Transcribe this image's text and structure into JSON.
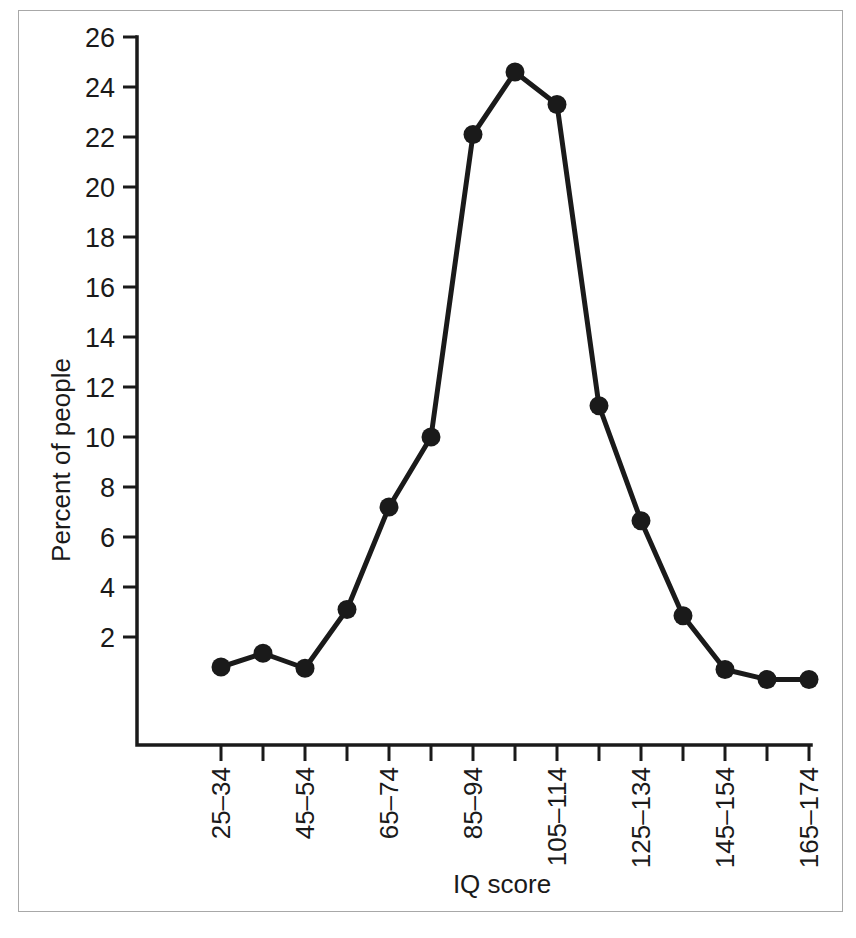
{
  "chart_data": {
    "type": "line",
    "title": "",
    "xlabel": "IQ score",
    "ylabel": "Percent of people",
    "categories": [
      "25–34",
      "35–44",
      "45–54",
      "55–64",
      "65–74",
      "75–84",
      "85–94",
      "95–104",
      "105–114",
      "115–124",
      "125–134",
      "135–144",
      "145–154",
      "155–164",
      "165–174"
    ],
    "visible_tick_labels": [
      "25–34",
      "",
      "45–54",
      "",
      "65–74",
      "",
      "85–94",
      "",
      "105–114",
      "",
      "125–134",
      "",
      "145–154",
      "",
      "165–174"
    ],
    "values": [
      0.8,
      1.35,
      0.75,
      3.1,
      7.2,
      10.0,
      22.1,
      24.6,
      23.3,
      11.25,
      6.65,
      2.85,
      0.7,
      0.3,
      0.3
    ],
    "ylim": [
      0,
      26
    ],
    "ytick_values": [
      2,
      4,
      6,
      8,
      10,
      12,
      14,
      16,
      18,
      20,
      22,
      24,
      26
    ],
    "ytick_labels": [
      "2",
      "4",
      "6",
      "8",
      "10",
      "12",
      "14",
      "16",
      "18",
      "20",
      "22",
      "24",
      "26"
    ],
    "grid": false,
    "legend": "none",
    "marker": "filled-circle",
    "line_color": "#1a1a1a",
    "marker_color": "#1a1a1a",
    "background_color": "#ffffff",
    "frame_border_color": "#a8a8a8"
  }
}
